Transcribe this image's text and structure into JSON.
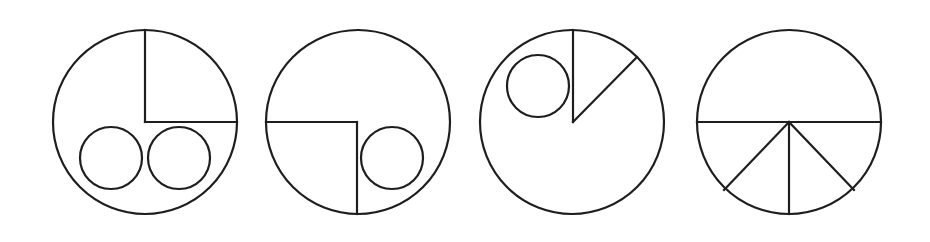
{
  "canvas": {
    "width": 930,
    "height": 242,
    "background": "#ffffff"
  },
  "style": {
    "stroke": "#1e1e1e",
    "stroke_width": 2.2
  },
  "figures": [
    {
      "id": "figure-1",
      "outer": {
        "cx": 145,
        "cy": 122,
        "r": 92
      },
      "lines": [
        {
          "x1": 145,
          "y1": 30,
          "x2": 145,
          "y2": 122
        },
        {
          "x1": 145,
          "y1": 122,
          "x2": 237,
          "y2": 122
        }
      ],
      "inner_circles": [
        {
          "cx": 111,
          "cy": 158,
          "r": 31
        },
        {
          "cx": 179,
          "cy": 158,
          "r": 31
        }
      ]
    },
    {
      "id": "figure-2",
      "outer": {
        "cx": 358,
        "cy": 122,
        "r": 92
      },
      "lines": [
        {
          "x1": 266,
          "y1": 122,
          "x2": 357,
          "y2": 122
        },
        {
          "x1": 357,
          "y1": 122,
          "x2": 357,
          "y2": 214
        }
      ],
      "inner_circles": [
        {
          "cx": 392,
          "cy": 158,
          "r": 31
        }
      ]
    },
    {
      "id": "figure-3",
      "outer": {
        "cx": 572,
        "cy": 122,
        "r": 92
      },
      "lines": [
        {
          "x1": 573,
          "y1": 30,
          "x2": 573,
          "y2": 122
        },
        {
          "x1": 573,
          "y1": 122,
          "x2": 637,
          "y2": 57
        }
      ],
      "inner_circles": [
        {
          "cx": 538,
          "cy": 86,
          "r": 31
        }
      ]
    },
    {
      "id": "figure-4",
      "outer": {
        "cx": 789,
        "cy": 122,
        "r": 92
      },
      "lines": [
        {
          "x1": 697,
          "y1": 122,
          "x2": 881,
          "y2": 122
        },
        {
          "x1": 789,
          "y1": 122,
          "x2": 789,
          "y2": 214
        },
        {
          "x1": 789,
          "y1": 122,
          "x2": 724,
          "y2": 190
        },
        {
          "x1": 789,
          "y1": 122,
          "x2": 854,
          "y2": 190
        }
      ],
      "inner_circles": []
    }
  ]
}
